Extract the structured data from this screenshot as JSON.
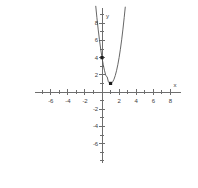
{
  "chart_data": {
    "type": "line",
    "title": "",
    "xlabel": "x",
    "ylabel": "y",
    "grid": false,
    "legend": "none",
    "xlim": [
      -7.8,
      9.2
    ],
    "ylim": [
      -8.2,
      9.8
    ],
    "x_ticks": [
      -6,
      -4,
      -2,
      2,
      4,
      6,
      8
    ],
    "x_tick_labels": [
      "-6",
      "-4",
      "-2",
      "2",
      "4",
      "6",
      "8"
    ],
    "x_minor_ticks": [
      -7,
      -5,
      -3,
      -1,
      1,
      3,
      5,
      7
    ],
    "y_ticks": [
      8,
      6,
      4,
      2,
      -2,
      -4,
      -6
    ],
    "y_tick_labels": [
      "8",
      "6",
      "4",
      "2",
      "-2",
      "-4",
      "-6"
    ],
    "y_minor_ticks": [
      9,
      7,
      5,
      3,
      1,
      -1,
      -3,
      -5,
      -7,
      -8
    ],
    "series": [
      {
        "name": "parabola",
        "equation": "y = 3(x - 1)^2 + 1",
        "color": "#555555",
        "x": [
          -0.73,
          -0.6,
          -0.45,
          -0.3,
          -0.15,
          0,
          0.15,
          0.3,
          0.45,
          0.6,
          0.75,
          0.9,
          1,
          1.1,
          1.25,
          1.4,
          1.55,
          1.7,
          1.85,
          2,
          2.15,
          2.3,
          2.45,
          2.6,
          2.72
        ],
        "y": [
          9.97,
          8.68,
          7.31,
          6.07,
          4.97,
          4.0,
          3.17,
          2.47,
          1.9,
          1.77,
          1.19,
          1.03,
          1.0,
          1.03,
          1.19,
          1.48,
          1.91,
          2.47,
          3.17,
          4.0,
          4.97,
          6.07,
          7.31,
          8.68,
          9.87
        ]
      }
    ],
    "points": [
      {
        "label": "y-intercept",
        "x": 0,
        "y": 4,
        "marker": "filled-square",
        "color": "#1a1a1a"
      },
      {
        "label": "vertex",
        "x": 1,
        "y": 1,
        "marker": "filled-square",
        "color": "#1a1a1a"
      }
    ],
    "axis_color": "#6e6e6e",
    "curve_color": "#555555"
  },
  "axes": {
    "x_label": "x",
    "y_label": "y"
  }
}
